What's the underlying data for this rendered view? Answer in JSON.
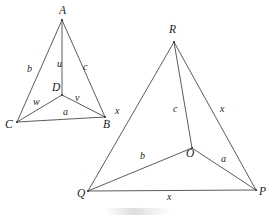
{
  "figure": {
    "canvas": {
      "width": 272,
      "height": 222,
      "background": "#ffffff"
    },
    "stroke_color": "#4a4a4a",
    "label_color": "#1c1c1c",
    "left_triangle": {
      "name": "triangle-ABC-with-interior-point-D",
      "vertices": [
        {
          "id": "A",
          "label": "A",
          "x": 62,
          "y": 20,
          "label_x": 59,
          "label_y": 5
        },
        {
          "id": "B",
          "label": "B",
          "x": 105,
          "y": 117,
          "label_x": 103,
          "label_y": 119
        },
        {
          "id": "C",
          "label": "C",
          "x": 17,
          "y": 122,
          "label_x": 5,
          "label_y": 119
        },
        {
          "id": "D",
          "label": "D",
          "x": 62,
          "y": 95,
          "label_x": 52,
          "label_y": 82
        }
      ],
      "edges": [
        {
          "from": "A",
          "to": "C",
          "label": "b",
          "label_x": 27,
          "label_y": 64
        },
        {
          "from": "A",
          "to": "B",
          "label": "c",
          "label_x": 83,
          "label_y": 62
        },
        {
          "from": "C",
          "to": "B",
          "label": "a",
          "label_x": 63,
          "label_y": 107
        },
        {
          "from": "A",
          "to": "D",
          "label": "u",
          "label_x": 57,
          "label_y": 59
        },
        {
          "from": "D",
          "to": "C",
          "label": "w",
          "label_x": 33,
          "label_y": 97
        },
        {
          "from": "D",
          "to": "B",
          "label": "v",
          "label_x": 75,
          "label_y": 93
        }
      ]
    },
    "right_triangle": {
      "name": "triangle-PQR-with-interior-point-O",
      "vertices": [
        {
          "id": "R",
          "label": "R",
          "x": 174,
          "y": 42,
          "label_x": 169,
          "label_y": 24
        },
        {
          "id": "P",
          "label": "P",
          "x": 256,
          "y": 190,
          "label_x": 259,
          "label_y": 186
        },
        {
          "id": "Q",
          "label": "Q",
          "x": 88,
          "y": 191,
          "label_x": 77,
          "label_y": 188
        },
        {
          "id": "O",
          "label": "O",
          "x": 192,
          "y": 148,
          "label_x": 186,
          "label_y": 148
        }
      ],
      "edges": [
        {
          "from": "R",
          "to": "Q",
          "label": "x",
          "label_x": 115,
          "label_y": 106
        },
        {
          "from": "R",
          "to": "P",
          "label": "x",
          "label_x": 220,
          "label_y": 104
        },
        {
          "from": "Q",
          "to": "P",
          "label": "x",
          "label_x": 167,
          "label_y": 192
        },
        {
          "from": "R",
          "to": "O",
          "label": "c",
          "label_x": 173,
          "label_y": 104
        },
        {
          "from": "O",
          "to": "Q",
          "label": "b",
          "label_x": 140,
          "label_y": 151
        },
        {
          "from": "O",
          "to": "P",
          "label": "a",
          "label_x": 221,
          "label_y": 154
        }
      ]
    }
  },
  "chart_data": {
    "type": "diagram",
    "title": "",
    "shapes": [
      {
        "id": "left",
        "polygon": [
          "A",
          "B",
          "C"
        ],
        "interior_point": "D",
        "points": {
          "A": [
            62,
            20
          ],
          "B": [
            105,
            117
          ],
          "C": [
            17,
            122
          ],
          "D": [
            62,
            95
          ]
        },
        "segments": [
          {
            "from": "A",
            "to": "C",
            "label": "b"
          },
          {
            "from": "A",
            "to": "B",
            "label": "c"
          },
          {
            "from": "C",
            "to": "B",
            "label": "a"
          },
          {
            "from": "A",
            "to": "D",
            "label": "u"
          },
          {
            "from": "D",
            "to": "C",
            "label": "w"
          },
          {
            "from": "D",
            "to": "B",
            "label": "v"
          }
        ]
      },
      {
        "id": "right",
        "polygon": [
          "R",
          "P",
          "Q"
        ],
        "interior_point": "O",
        "points": {
          "R": [
            174,
            42
          ],
          "P": [
            256,
            190
          ],
          "Q": [
            88,
            191
          ],
          "O": [
            192,
            148
          ]
        },
        "segments": [
          {
            "from": "R",
            "to": "Q",
            "label": "x"
          },
          {
            "from": "R",
            "to": "P",
            "label": "x"
          },
          {
            "from": "Q",
            "to": "P",
            "label": "x"
          },
          {
            "from": "R",
            "to": "O",
            "label": "c"
          },
          {
            "from": "O",
            "to": "Q",
            "label": "b"
          },
          {
            "from": "O",
            "to": "P",
            "label": "a"
          }
        ]
      }
    ]
  }
}
